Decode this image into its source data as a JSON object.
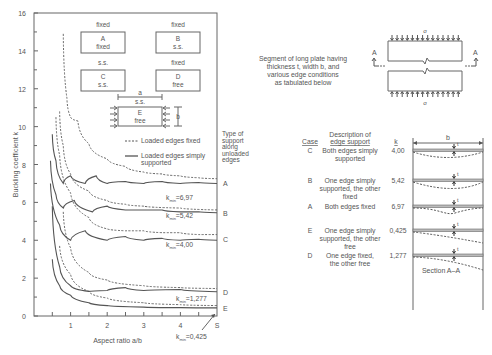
{
  "chart_data": {
    "type": "line",
    "title": "",
    "xlabel": "Aspect ratio a/b",
    "ylabel": "Buckling coefficient k",
    "xlim": [
      0,
      5
    ],
    "ylim": [
      0,
      16
    ],
    "x_ticks": [
      "1",
      "2",
      "3",
      "4",
      "S"
    ],
    "y_ticks": [
      "0",
      "2",
      "4",
      "6",
      "8",
      "10",
      "12",
      "14",
      "16"
    ],
    "grid": false,
    "legend": [
      {
        "style": "dashed",
        "label": "Loaded edges fixed"
      },
      {
        "style": "solid",
        "label": "Loaded edges simply supported"
      }
    ],
    "legend_right_label": "Type of support along unloaded edges",
    "series": [
      {
        "name": "A",
        "loaded_edges": "simply supported",
        "k_min": 6.97,
        "x": [
          0.5,
          0.6,
          0.8,
          1.0,
          1.4,
          1.7,
          2.0,
          2.5,
          3.0,
          3.5,
          4.0,
          4.5,
          5.0
        ],
        "y": [
          9.6,
          8.2,
          7.0,
          7.4,
          7.0,
          7.4,
          7.0,
          7.1,
          7.0,
          7.1,
          7.0,
          7.05,
          7.0
        ]
      },
      {
        "name": "A",
        "loaded_edges": "fixed",
        "x": [
          0.8,
          0.9,
          1.0,
          1.2,
          1.5,
          2.0,
          2.5,
          3.0,
          3.5,
          4.0,
          4.5,
          5.0
        ],
        "y": [
          14.9,
          11.5,
          10.5,
          10.3,
          9.1,
          8.3,
          7.9,
          7.6,
          7.5,
          7.4,
          7.3,
          7.25
        ]
      },
      {
        "name": "B",
        "loaded_edges": "simply supported",
        "k_min": 5.42,
        "x": [
          0.45,
          0.6,
          0.8,
          1.1,
          1.6,
          2.0,
          2.5,
          3.0,
          3.5,
          4.0,
          4.5,
          5.0
        ],
        "y": [
          8.2,
          6.4,
          5.7,
          6.1,
          5.5,
          5.8,
          5.6,
          5.6,
          5.6,
          5.5,
          5.5,
          5.45
        ]
      },
      {
        "name": "B",
        "loaded_edges": "fixed",
        "x": [
          0.7,
          0.8,
          1.0,
          1.5,
          2.0,
          2.5,
          3.0,
          4.0,
          5.0
        ],
        "y": [
          10.8,
          9.0,
          7.5,
          6.6,
          6.1,
          5.9,
          5.8,
          5.7,
          5.6
        ]
      },
      {
        "name": "C",
        "loaded_edges": "simply supported",
        "k_min": 4.0,
        "x": [
          0.45,
          0.7,
          1.0,
          1.4,
          2.0,
          2.5,
          3.0,
          3.5,
          4.0,
          4.5,
          5.0
        ],
        "y": [
          7.0,
          4.8,
          4.0,
          4.5,
          4.0,
          4.2,
          4.0,
          4.1,
          4.0,
          4.05,
          4.0
        ]
      },
      {
        "name": "C",
        "loaded_edges": "fixed",
        "x": [
          0.6,
          0.7,
          1.0,
          1.5,
          2.0,
          2.5,
          3.0,
          3.5,
          4.0,
          4.5,
          5.0
        ],
        "y": [
          10.5,
          8.5,
          6.5,
          5.2,
          4.6,
          4.5,
          4.5,
          4.4,
          4.4,
          4.3,
          4.3
        ]
      },
      {
        "name": "D",
        "loaded_edges": "simply supported",
        "k_min": 1.277,
        "x": [
          0.5,
          0.7,
          1.0,
          1.5,
          2.0,
          2.5,
          3.0,
          4.0,
          5.0
        ],
        "y": [
          5.8,
          2.6,
          1.6,
          1.3,
          1.35,
          1.5,
          1.35,
          1.4,
          1.28
        ]
      },
      {
        "name": "D",
        "loaded_edges": "fixed",
        "x": [
          0.8,
          1.0,
          1.5,
          2.0,
          3.0,
          4.0,
          5.0
        ],
        "y": [
          5.5,
          3.6,
          2.3,
          1.9,
          1.6,
          1.5,
          1.45
        ]
      },
      {
        "name": "E",
        "loaded_edges": "simply supported",
        "k_min": 0.425,
        "x": [
          0.5,
          0.7,
          1.0,
          1.5,
          2.0,
          3.0,
          4.0,
          5.0
        ],
        "y": [
          3.0,
          1.6,
          1.1,
          0.7,
          0.55,
          0.47,
          0.44,
          0.43
        ]
      },
      {
        "name": "E",
        "loaded_edges": "fixed",
        "x": [
          0.7,
          1.0,
          1.5,
          2.0,
          3.0,
          4.0,
          5.0
        ],
        "y": [
          3.7,
          2.2,
          1.3,
          0.95,
          0.7,
          0.6,
          0.55
        ]
      }
    ],
    "annotations": [
      "kmin=6,97",
      "kmin=5,42",
      "kmin=4,00",
      "kmin=1,277",
      "kmin=0,425"
    ]
  },
  "plate_icons": [
    {
      "top": "fixed",
      "case": "A",
      "side": "fixed"
    },
    {
      "top": "fixed",
      "case": "B",
      "side": "s.s."
    },
    {
      "top": "s.s.",
      "case": "C",
      "side": "s.s."
    },
    {
      "top": "fixed",
      "case": "D",
      "side": "free"
    },
    {
      "top": "s.s.",
      "case": "E",
      "side": "free",
      "dim_a": "a",
      "dim_b": "b"
    }
  ],
  "curve_labels": [
    "A",
    "B",
    "C",
    "D",
    "E"
  ],
  "kmin_labels": {
    "A": "6,97",
    "B": "5,42",
    "C": "4,00",
    "D": "1,277",
    "E": "0,425",
    "prefix": "k",
    "sub": "min"
  },
  "plate_segment": {
    "caption": [
      "Segment of long plate having",
      "thickness t, width b, and",
      "various edge conditions",
      "as tabulated below"
    ],
    "stress_symbol": "σ",
    "section_marker": "A"
  },
  "table": {
    "headers": {
      "case": "Case",
      "desc": [
        "Description of",
        "edge support"
      ],
      "k": "k",
      "b": "b"
    },
    "rows": [
      {
        "case": "C",
        "desc": [
          "Both edges simply",
          "supported"
        ],
        "k": "4,00"
      },
      {
        "case": "B",
        "desc": [
          "One edge simply",
          "supported, the other",
          "fixed"
        ],
        "k": "5,42"
      },
      {
        "case": "A",
        "desc": [
          "Both edges fixed"
        ],
        "k": "6,97"
      },
      {
        "case": "E",
        "desc": [
          "One edge simply",
          "supported, the other",
          "free"
        ],
        "k": "0,425"
      },
      {
        "case": "D",
        "desc": [
          "One edge fixed,",
          "the other free"
        ],
        "k": "1,277"
      }
    ],
    "thickness_label": "t",
    "section_caption": "Section A–A"
  }
}
